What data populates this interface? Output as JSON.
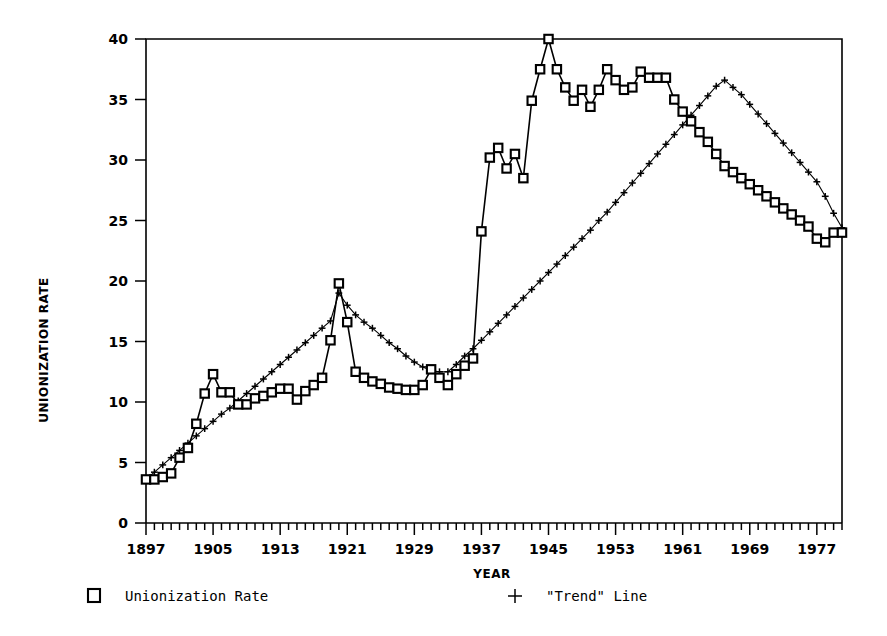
{
  "chart_data": {
    "type": "line",
    "title": "",
    "xlabel": "YEAR",
    "ylabel": "UNIONIZATION RATE",
    "xlim": [
      1897,
      1980
    ],
    "ylim": [
      0,
      40
    ],
    "yticks": [
      0,
      5,
      10,
      15,
      20,
      25,
      30,
      35,
      40
    ],
    "xticks": [
      1897,
      1905,
      1913,
      1921,
      1929,
      1937,
      1945,
      1953,
      1961,
      1969,
      1977
    ],
    "xtick_labels": [
      "1897",
      "1905",
      "1913",
      "1921",
      "1929",
      "1937",
      "1945",
      "1953",
      "1961",
      "1969",
      "1977"
    ],
    "ytick_labels": [
      "0",
      "5",
      "10",
      "15",
      "20",
      "25",
      "30",
      "35",
      "40"
    ],
    "grid": false,
    "minor_xtick_step": 1,
    "legend_position": "below-axes",
    "x": [
      1897,
      1898,
      1899,
      1900,
      1901,
      1902,
      1903,
      1904,
      1905,
      1906,
      1907,
      1908,
      1909,
      1910,
      1911,
      1912,
      1913,
      1914,
      1915,
      1916,
      1917,
      1918,
      1919,
      1920,
      1921,
      1922,
      1923,
      1924,
      1925,
      1926,
      1927,
      1928,
      1929,
      1930,
      1931,
      1932,
      1933,
      1934,
      1935,
      1936,
      1937,
      1938,
      1939,
      1940,
      1941,
      1942,
      1943,
      1944,
      1945,
      1946,
      1947,
      1948,
      1949,
      1950,
      1951,
      1952,
      1953,
      1954,
      1955,
      1956,
      1957,
      1958,
      1959,
      1960,
      1961,
      1962,
      1963,
      1964,
      1965,
      1966,
      1967,
      1968,
      1969,
      1970,
      1971,
      1972,
      1973,
      1974,
      1975,
      1976,
      1977,
      1978,
      1979,
      1980
    ],
    "series": [
      {
        "name": "Unionization Rate",
        "marker": "square",
        "values": [
          3.6,
          3.6,
          3.8,
          4.1,
          5.4,
          6.2,
          8.2,
          10.7,
          12.3,
          10.8,
          10.8,
          9.8,
          9.8,
          10.3,
          10.5,
          10.8,
          11.1,
          11.1,
          10.2,
          10.9,
          11.4,
          12.0,
          15.1,
          19.8,
          16.6,
          12.5,
          12.0,
          11.7,
          11.5,
          11.2,
          11.1,
          11.0,
          11.0,
          11.4,
          12.7,
          12.0,
          11.4,
          12.3,
          13.0,
          13.6,
          24.1,
          30.2,
          31.0,
          29.3,
          30.5,
          28.5,
          34.9,
          37.5,
          40.0,
          37.5,
          36.0,
          34.9,
          35.8,
          34.4,
          35.8,
          37.5,
          36.6,
          35.8,
          36.0,
          37.3,
          36.8,
          36.8,
          36.8,
          35.0,
          34.0,
          33.2,
          32.3,
          31.5,
          30.5,
          29.5,
          29.0,
          28.5,
          28.0,
          27.5,
          27.0,
          26.5,
          26.0,
          25.5,
          25.0,
          24.5,
          23.5,
          23.2,
          24.0,
          24.0
        ]
      },
      {
        "name": "\"Trend\" Line",
        "marker": "plus",
        "values": [
          3.6,
          4.2,
          4.8,
          5.4,
          6.0,
          6.6,
          7.2,
          7.8,
          8.4,
          9.0,
          9.5,
          10.1,
          10.7,
          11.3,
          11.9,
          12.5,
          13.1,
          13.7,
          14.3,
          14.9,
          15.5,
          16.1,
          16.7,
          19.0,
          18.0,
          17.2,
          16.6,
          16.1,
          15.5,
          14.9,
          14.4,
          13.8,
          13.3,
          12.9,
          12.6,
          12.5,
          12.5,
          13.1,
          13.8,
          14.4,
          15.1,
          15.8,
          16.5,
          17.2,
          17.9,
          18.6,
          19.3,
          20.0,
          20.7,
          21.4,
          22.1,
          22.8,
          23.5,
          24.2,
          25.0,
          25.7,
          26.5,
          27.3,
          28.1,
          28.9,
          29.7,
          30.5,
          31.3,
          32.1,
          32.9,
          33.7,
          34.5,
          35.3,
          36.1,
          36.6,
          36.0,
          35.4,
          34.6,
          33.8,
          33.0,
          32.2,
          31.4,
          30.6,
          29.8,
          29.0,
          28.2,
          27.0,
          25.6,
          24.4
        ]
      }
    ],
    "legend": [
      {
        "label": "Unionization Rate",
        "marker": "square"
      },
      {
        "label": "\"Trend\" Line",
        "marker": "plus"
      }
    ]
  }
}
